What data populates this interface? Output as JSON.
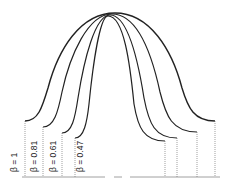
{
  "diagram": {
    "title": "",
    "curves": [
      {
        "id": "beta-1",
        "label": "β = 1",
        "left": [
          25,
          121
        ],
        "right": [
          215,
          121
        ],
        "apex_y": 13
      },
      {
        "id": "beta-0.81",
        "label": "β = 0.81",
        "left": [
          43,
          127
        ],
        "right": [
          197,
          132
        ],
        "apex_y": 14
      },
      {
        "id": "beta-0.61",
        "label": "β = 0.61",
        "left": [
          62,
          133
        ],
        "right": [
          177,
          138
        ],
        "apex_y": 15
      },
      {
        "id": "beta-0.47",
        "label": "β = 0.47",
        "left": [
          75,
          138
        ],
        "right": [
          165,
          141
        ],
        "apex_y": 16
      }
    ],
    "baseline_y": 177,
    "colors": {
      "curve": "#222222",
      "dotted": "#777777",
      "baseline": "#888888"
    }
  }
}
